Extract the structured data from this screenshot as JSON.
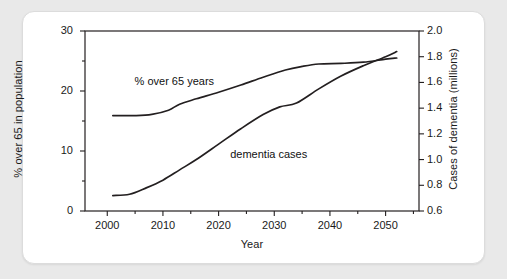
{
  "figure": {
    "background_color": "#e9e9e9",
    "card_color": "#ffffff",
    "line_color": "#231f20"
  },
  "chart_data": {
    "type": "line",
    "title": "",
    "xlabel": "Year",
    "ylabel": "% over 65 in population",
    "y2label": "Cases of dementia (millions)",
    "xlim": [
      1996,
      2056
    ],
    "ylim": [
      0,
      30
    ],
    "y2lim": [
      0.6,
      2.0
    ],
    "grid": false,
    "legend": "inline-annotations",
    "x_ticks": [
      "2000",
      "2010",
      "2020",
      "2030",
      "2040",
      "2050"
    ],
    "x_tick_values": [
      2000,
      2010,
      2020,
      2030,
      2040,
      2050
    ],
    "x_minor_tick_values": [
      1995,
      2005,
      2015,
      2025,
      2035,
      2045,
      2055
    ],
    "y_ticks": [
      "0",
      "10",
      "20",
      "30"
    ],
    "y_tick_values": [
      0,
      10,
      20,
      30
    ],
    "y_minor_tick_values": [
      5,
      15,
      25
    ],
    "y2_ticks": [
      "0.6",
      "0.8",
      "1.0",
      "1.2",
      "1.4",
      "1.6",
      "1.8",
      "2.0"
    ],
    "y2_tick_values": [
      0.6,
      0.8,
      1.0,
      1.2,
      1.4,
      1.6,
      1.8,
      2.0
    ],
    "series": [
      {
        "name": "% over 65 years",
        "axis": "left",
        "units": "percent",
        "x": [
          2001,
          2005,
          2008,
          2011,
          2013,
          2016,
          2020,
          2024,
          2028,
          2032,
          2035,
          2038,
          2042,
          2046,
          2050,
          2052
        ],
        "values": [
          15.9,
          15.9,
          16.1,
          16.8,
          17.8,
          18.7,
          19.8,
          21.0,
          22.3,
          23.5,
          24.1,
          24.5,
          24.6,
          24.8,
          25.3,
          25.5
        ]
      },
      {
        "name": "dementia cases",
        "axis": "right",
        "units": "millions",
        "x": [
          2001,
          2004,
          2007,
          2010,
          2013,
          2016,
          2020,
          2024,
          2028,
          2031,
          2034,
          2038,
          2042,
          2046,
          2050,
          2052
        ],
        "values": [
          0.72,
          0.73,
          0.78,
          0.84,
          0.92,
          1.0,
          1.12,
          1.24,
          1.35,
          1.41,
          1.44,
          1.55,
          1.65,
          1.73,
          1.8,
          1.84
        ]
      }
    ],
    "annotations": [
      {
        "text": "% over 65 years",
        "x": 2012,
        "y": 21.5
      },
      {
        "text": "dementia cases",
        "x": 2029,
        "y": 9.4
      }
    ]
  }
}
